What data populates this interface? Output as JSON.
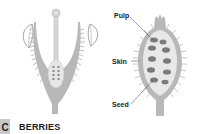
{
  "figure": {
    "title": "BERRIES",
    "badge": "C",
    "labels": {
      "pulp": "Pulp",
      "skin": "Skin",
      "seed": "Seed"
    },
    "colors": {
      "tissue": "#b8b8b8",
      "tissue_light": "#e6e6e6",
      "seed": "#7a7a7a",
      "leaf_outline": "#9a9a9a"
    }
  }
}
